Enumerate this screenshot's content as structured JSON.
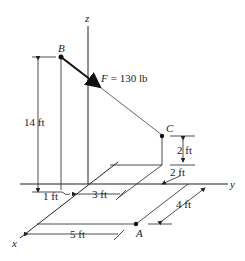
{
  "diagram": {
    "axes": {
      "x": "x",
      "y": "y",
      "z": "z"
    },
    "points": {
      "A": "A",
      "B": "B",
      "C": "C"
    },
    "force": {
      "symbol": "F",
      "equals": "= 130 lb"
    },
    "dimensions": {
      "height_B": "14 ft",
      "offset_1": "1 ft",
      "offset_3": "3 ft",
      "height_C": "2 ft",
      "offset_C_y": "2 ft",
      "offset_A_x": "4 ft",
      "offset_A_y": "5 ft"
    },
    "colors": {
      "line": "#222222",
      "background": "#ffffff"
    }
  }
}
